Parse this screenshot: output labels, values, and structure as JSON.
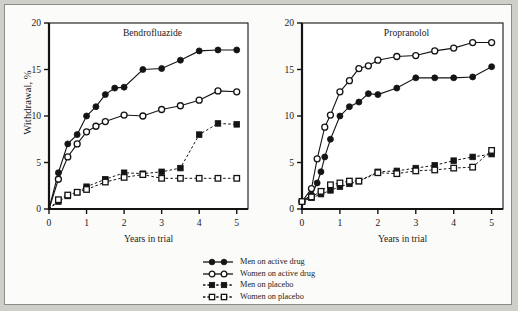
{
  "figure": {
    "ylabel": "Withdrawal, %",
    "xlabel": "Years in trial",
    "background": "#fbfbf9",
    "frame_color": "#8d8d88"
  },
  "legend": {
    "position": "bottom-center",
    "items": [
      {
        "label": "Men on active drug",
        "marker": "filled-circle",
        "line": "solid",
        "color": "#141414"
      },
      {
        "label": "Women on active drug",
        "marker": "open-circle",
        "line": "solid",
        "color": "#141414"
      },
      {
        "label": "Men on placebo",
        "marker": "filled-square",
        "line": "dashed",
        "color": "#141414"
      },
      {
        "label": "Women on placebo",
        "marker": "open-square",
        "line": "dashed",
        "color": "#141414"
      }
    ]
  },
  "chart_data": [
    {
      "type": "line",
      "title": "Bendrofluazide",
      "xlabel": "Years in trial",
      "ylabel": "Withdrawal, %",
      "xlim": [
        0,
        5.3
      ],
      "ylim": [
        0,
        20
      ],
      "xticks": [
        0,
        1,
        2,
        3,
        4,
        5
      ],
      "yticks": [
        0,
        5,
        10,
        15,
        20
      ],
      "grid": false,
      "series": [
        {
          "name": "Men on active drug",
          "marker": "filled-circle",
          "line": "solid",
          "x": [
            0.0,
            0.25,
            0.5,
            0.75,
            1.0,
            1.25,
            1.5,
            1.75,
            2.0,
            2.5,
            3.0,
            3.5,
            4.0,
            4.5,
            5.0
          ],
          "y": [
            0.0,
            3.9,
            7.0,
            8.0,
            10.0,
            11.0,
            12.3,
            13.0,
            13.1,
            15.0,
            15.1,
            16.0,
            17.0,
            17.1,
            17.1
          ]
        },
        {
          "name": "Women on active drug",
          "marker": "open-circle",
          "line": "solid",
          "x": [
            0.0,
            0.25,
            0.5,
            0.75,
            1.0,
            1.25,
            1.5,
            2.0,
            2.5,
            3.0,
            3.5,
            4.0,
            4.5,
            5.0
          ],
          "y": [
            0.0,
            3.2,
            5.6,
            7.0,
            8.3,
            8.9,
            9.4,
            10.1,
            10.0,
            10.7,
            11.1,
            11.7,
            12.7,
            12.6
          ]
        },
        {
          "name": "Men on placebo",
          "marker": "filled-square",
          "line": "dashed",
          "x": [
            0.0,
            0.25,
            0.5,
            0.75,
            1.0,
            1.5,
            2.0,
            2.5,
            3.0,
            3.5,
            4.0,
            4.5,
            5.0
          ],
          "y": [
            0.0,
            0.8,
            1.4,
            1.8,
            2.4,
            3.2,
            3.9,
            3.8,
            4.0,
            4.4,
            8.0,
            9.2,
            9.1
          ]
        },
        {
          "name": "Women on placebo",
          "marker": "open-square",
          "line": "dashed",
          "x": [
            0.0,
            0.25,
            0.5,
            0.75,
            1.0,
            1.5,
            2.0,
            2.5,
            3.0,
            3.5,
            4.0,
            4.5,
            5.0
          ],
          "y": [
            0.0,
            1.0,
            1.5,
            1.8,
            2.1,
            2.9,
            3.4,
            3.7,
            3.3,
            3.3,
            3.3,
            3.3,
            3.3
          ]
        }
      ]
    },
    {
      "type": "line",
      "title": "Propranolol",
      "xlabel": "Years in trial",
      "ylabel": "Withdrawal, %",
      "xlim": [
        0,
        5.3
      ],
      "ylim": [
        0,
        20
      ],
      "xticks": [
        0,
        1,
        2,
        3,
        4,
        5
      ],
      "yticks": [
        0,
        5,
        10,
        15,
        20
      ],
      "grid": false,
      "series": [
        {
          "name": "Men on active drug",
          "marker": "filled-circle",
          "line": "solid",
          "x": [
            0.0,
            0.25,
            0.4,
            0.5,
            0.6,
            0.75,
            1.0,
            1.25,
            1.5,
            1.75,
            2.0,
            2.5,
            3.0,
            3.5,
            4.0,
            4.5,
            5.0
          ],
          "y": [
            0.8,
            1.5,
            2.8,
            4.0,
            5.6,
            7.5,
            10.0,
            11.0,
            11.5,
            12.4,
            12.3,
            13.0,
            14.1,
            14.1,
            14.1,
            14.2,
            15.3
          ]
        },
        {
          "name": "Women on active drug",
          "marker": "open-circle",
          "line": "solid",
          "x": [
            0.0,
            0.25,
            0.4,
            0.6,
            0.75,
            1.0,
            1.25,
            1.5,
            1.75,
            2.0,
            2.5,
            3.0,
            3.5,
            4.0,
            4.5,
            5.0
          ],
          "y": [
            0.8,
            2.2,
            5.4,
            8.8,
            10.1,
            12.6,
            13.8,
            15.1,
            15.4,
            16.0,
            16.4,
            16.5,
            17.0,
            17.3,
            17.9,
            17.9
          ]
        },
        {
          "name": "Men on placebo",
          "marker": "filled-square",
          "line": "dashed",
          "x": [
            0.0,
            0.25,
            0.5,
            0.75,
            1.0,
            1.25,
            1.5,
            2.0,
            2.5,
            3.0,
            3.5,
            4.0,
            4.5,
            5.0
          ],
          "y": [
            0.8,
            1.2,
            1.6,
            2.0,
            2.4,
            2.7,
            3.0,
            4.0,
            4.1,
            4.4,
            4.7,
            5.2,
            5.6,
            5.9
          ]
        },
        {
          "name": "Women on placebo",
          "marker": "open-square",
          "line": "dashed",
          "x": [
            0.0,
            0.25,
            0.5,
            0.75,
            1.0,
            1.25,
            1.5,
            2.0,
            2.5,
            3.0,
            3.5,
            4.0,
            4.5,
            5.0
          ],
          "y": [
            0.8,
            1.3,
            1.9,
            2.6,
            2.8,
            3.0,
            3.0,
            3.9,
            3.8,
            4.1,
            4.2,
            4.4,
            4.5,
            6.3
          ]
        }
      ]
    }
  ]
}
